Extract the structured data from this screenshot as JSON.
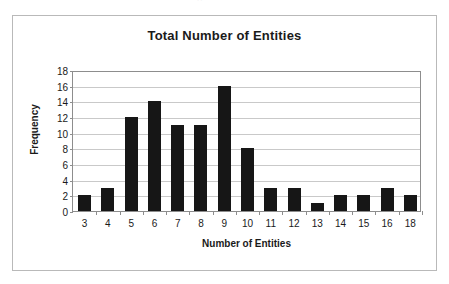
{
  "artifact": {
    "text": "''"
  },
  "chart_data": {
    "type": "bar",
    "title": "Total Number of Entities",
    "xlabel": "Number of Entities",
    "ylabel": "Frequency",
    "categories": [
      "3",
      "4",
      "5",
      "6",
      "7",
      "8",
      "9",
      "10",
      "11",
      "12",
      "13",
      "14",
      "15",
      "16",
      "18"
    ],
    "values": [
      2,
      3,
      12,
      14,
      11,
      11,
      16,
      8,
      3,
      3,
      1,
      2,
      2,
      3,
      2
    ],
    "ylim": [
      0,
      18
    ],
    "yticks": [
      "0",
      "2",
      "4",
      "6",
      "8",
      "10",
      "12",
      "14",
      "16",
      "18"
    ],
    "ytick_values": [
      0,
      2,
      4,
      6,
      8,
      10,
      12,
      14,
      16,
      18
    ],
    "grid": true,
    "legend": "none",
    "colors": {
      "bar": "#161616",
      "gridline": "#c9c9c9",
      "axis": "#8d8d8d",
      "frame": "#b9b9b9",
      "background": "#ffffff",
      "text": "#1a1a1a"
    }
  }
}
